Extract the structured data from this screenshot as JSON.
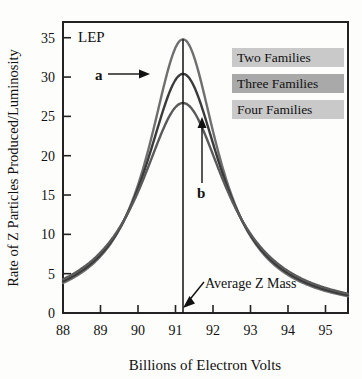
{
  "chart_data": {
    "type": "line",
    "title": "",
    "xlabel": "Billions of Electron Volts",
    "ylabel": "Rate of Z Particles Produced/Luminosity",
    "xlim": [
      88,
      95.6
    ],
    "ylim": [
      0,
      37
    ],
    "xticks": [
      88,
      89,
      90,
      91,
      92,
      93,
      94,
      95
    ],
    "xtick_labels": [
      "88",
      "89",
      "90",
      "91",
      "92",
      "93",
      "94",
      "95"
    ],
    "yticks": [
      0,
      5,
      10,
      15,
      20,
      25,
      30,
      35
    ],
    "ytick_labels": [
      "0",
      "5",
      "10",
      "15",
      "20",
      "25",
      "30",
      "35"
    ],
    "grid": false,
    "legend_position": "top-right",
    "resonance_center": 91.2,
    "series": [
      {
        "name": "Two Families",
        "color": "#6f6f6f",
        "peak_value": 34.8,
        "peak_x": 91.2,
        "width_gamma": 2.25,
        "x": [
          88.0,
          88.4,
          88.8,
          89.2,
          89.6,
          90.0,
          90.4,
          90.8,
          91.2,
          91.6,
          92.0,
          92.4,
          92.8,
          93.2,
          93.6,
          94.0,
          94.4,
          94.8,
          95.2,
          95.6
        ],
        "values": [
          4.4,
          5.3,
          6.6,
          8.6,
          11.6,
          16.2,
          23.0,
          31.0,
          34.8,
          30.2,
          22.0,
          15.3,
          10.8,
          7.9,
          6.0,
          4.8,
          3.9,
          3.3,
          2.8,
          2.4
        ]
      },
      {
        "name": "Three Families",
        "color": "#3a3a3a",
        "peak_value": 30.4,
        "peak_x": 91.2,
        "width_gamma": 2.5,
        "x": [
          88.0,
          88.4,
          88.8,
          89.2,
          89.6,
          90.0,
          90.4,
          90.8,
          91.2,
          91.6,
          92.0,
          92.4,
          92.8,
          93.2,
          93.6,
          94.0,
          94.4,
          94.8,
          95.2,
          95.6
        ],
        "values": [
          4.7,
          5.6,
          6.9,
          8.8,
          11.6,
          15.7,
          21.3,
          27.4,
          30.4,
          27.0,
          20.8,
          15.1,
          11.0,
          8.3,
          6.4,
          5.2,
          4.3,
          3.6,
          3.1,
          2.7
        ]
      },
      {
        "name": "Four Families",
        "color": "#5a5a5a",
        "peak_value": 26.7,
        "peak_x": 91.2,
        "width_gamma": 2.8,
        "x": [
          88.0,
          88.4,
          88.8,
          89.2,
          89.6,
          90.0,
          90.4,
          90.8,
          91.2,
          91.6,
          92.0,
          92.4,
          92.8,
          93.2,
          93.6,
          94.0,
          94.4,
          94.8,
          95.2,
          95.6
        ],
        "values": [
          4.9,
          5.8,
          7.0,
          8.8,
          11.3,
          14.9,
          19.6,
          24.4,
          26.7,
          24.2,
          19.4,
          14.6,
          11.0,
          8.5,
          6.7,
          5.5,
          4.6,
          3.9,
          3.4,
          2.9
        ]
      }
    ],
    "annotations": [
      {
        "name": "lep-label",
        "text": "LEP",
        "x": 88.35,
        "y": 35.2
      },
      {
        "name": "curve-a-label",
        "text": "a",
        "x": 89.7,
        "y": 30.3
      },
      {
        "name": "curve-b-label",
        "text": "b",
        "x": 91.95,
        "y": 15.4
      },
      {
        "name": "average-z-mass-label",
        "text": "Average Z Mass",
        "x": 92.0,
        "y": 3.6
      }
    ]
  },
  "legend": {
    "items": [
      {
        "label": "Two Families",
        "swatch_color": "#c9c9c9"
      },
      {
        "label": "Three Families",
        "swatch_color": "#a9a9a9"
      },
      {
        "label": "Four Families",
        "swatch_color": "#c9c9c9"
      }
    ]
  },
  "axes": {
    "x_title": "Billions of Electron Volts",
    "y_title": "Rate of Z Particles Produced/Luminosity"
  }
}
